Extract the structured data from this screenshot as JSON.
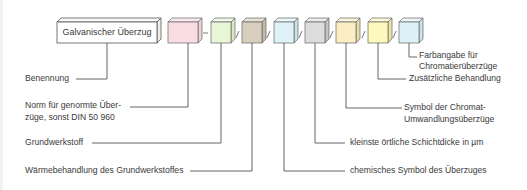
{
  "diagram": {
    "main_box": {
      "label": "Galvanischer  Überzug"
    },
    "separators": [
      "-",
      "/",
      "/",
      "/",
      "/",
      "/",
      "/"
    ],
    "boxes": [
      {
        "id": "norm",
        "color": "#f9dde3"
      },
      {
        "id": "grundwerkstoff",
        "color": "#e8f5d6"
      },
      {
        "id": "waermebehandlung",
        "color": "#d9cebd"
      },
      {
        "id": "chem-symbol",
        "color": "#dff2f7"
      },
      {
        "id": "schichtdicke",
        "color": "#dcdcdc"
      },
      {
        "id": "chromat-symbol",
        "color": "#fbeec3"
      },
      {
        "id": "zusaetzliche-behandlung",
        "color": "#fdf8bd"
      },
      {
        "id": "farbangabe",
        "color": "#ddf2f8"
      }
    ],
    "left_labels": {
      "benennung": "Benennung",
      "norm_line1": "Norm für genormte Über-",
      "norm_line2": "züge, sonst DIN 50 960",
      "grundwerkstoff": "Grundwerkstoff",
      "waermebehandlung": "Wärmebehandlung des Grundwerkstoffes"
    },
    "right_labels": {
      "farbangabe_line1": "Farbangabe für",
      "farbangabe_line2": "Chromatierüberzüge",
      "zusaetzliche": "Zusätzliche Behandlung",
      "symbol_line1": "Symbol der Chromat-",
      "symbol_line2": "Umwandlungsüberzüge",
      "schichtdicke": "kleinste örtliche Schichtdicke in µm",
      "chem_symbol": "chemisches Symbol des Überzuges"
    }
  }
}
